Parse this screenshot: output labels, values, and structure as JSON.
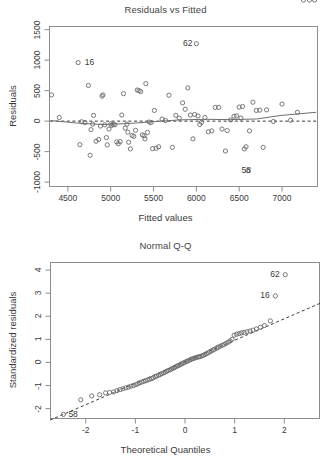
{
  "figure": {
    "kind": "r-regression-diagnostic-plots",
    "panel_count": 2
  },
  "panels": [
    {
      "id": "residuals-vs-fitted",
      "title": "Residuals vs Fitted",
      "xlabel": "Fitted values",
      "ylabel": "Residuals",
      "xticks": [
        "4500",
        "5000",
        "5500",
        "6000",
        "6500",
        "7000"
      ],
      "yticks": [
        "1500",
        "1000",
        "500",
        "0",
        "-500",
        "-1000"
      ],
      "point_labels": [
        {
          "text": "62",
          "x": 6020,
          "y": 1270,
          "side": "left"
        },
        {
          "text": "16",
          "x": 4640,
          "y": 960,
          "side": "right"
        },
        {
          "text": "58",
          "x": 6470,
          "y": -810,
          "side": "right"
        }
      ]
    },
    {
      "id": "normal-q-q",
      "title": "Normal Q-Q",
      "xlabel": "Theoretical Quantiles",
      "ylabel": "Standardized residuals",
      "xticks": [
        "-2",
        "-1",
        "0",
        "1",
        "2"
      ],
      "yticks": [
        "-2",
        "-1",
        "0",
        "1",
        "2",
        "3",
        "4"
      ],
      "point_labels": [
        {
          "text": "62",
          "x": 2.02,
          "y": 3.8,
          "side": "left"
        },
        {
          "text": "16",
          "x": 1.82,
          "y": 2.88,
          "side": "left"
        },
        {
          "text": "58",
          "x": -2.45,
          "y": -2.25,
          "side": "right"
        }
      ]
    }
  ],
  "chart_data": [
    {
      "type": "scatter",
      "title": "Residuals vs Fitted",
      "xlabel": "Fitted values",
      "ylabel": "Residuals",
      "xlim": [
        4280,
        7420
      ],
      "ylim": [
        -1080,
        1560
      ],
      "xticks": [
        4500,
        5000,
        5500,
        6000,
        6500,
        7000
      ],
      "yticks": [
        -1000,
        -500,
        0,
        500,
        1000,
        1500
      ],
      "grid": false,
      "legend": null,
      "reference_line": {
        "type": "horizontal-dashed",
        "y": 0
      },
      "smoother": {
        "type": "lowess",
        "x": [
          4300,
          4600,
          4900,
          5200,
          5500,
          5800,
          6100,
          6400,
          6700,
          7000,
          7400
        ],
        "y": [
          10,
          -30,
          -55,
          -40,
          -10,
          20,
          30,
          25,
          35,
          95,
          145
        ]
      },
      "x": [
        4310,
        4400,
        4620,
        4640,
        4660,
        4700,
        4740,
        4760,
        4770,
        4790,
        4800,
        4830,
        4860,
        4880,
        4900,
        4910,
        4930,
        4950,
        4960,
        4980,
        5000,
        5010,
        5030,
        5050,
        5070,
        5090,
        5110,
        5130,
        5150,
        5170,
        5190,
        5200,
        5210,
        5230,
        5250,
        5270,
        5290,
        5310,
        5330,
        5350,
        5370,
        5390,
        5400,
        5410,
        5430,
        5450,
        5470,
        5490,
        5510,
        5530,
        5560,
        5600,
        5640,
        5680,
        5720,
        5760,
        5800,
        5840,
        5870,
        5900,
        5930,
        5960,
        5980,
        6000,
        6020,
        6040,
        6060,
        6100,
        6140,
        6180,
        6220,
        6260,
        6300,
        6340,
        6360,
        6400,
        6440,
        6470,
        6500,
        6520,
        6540,
        6560,
        6580,
        6600,
        6620,
        6660,
        6700,
        6740,
        6780,
        6820,
        6900,
        7000,
        7100,
        7180,
        7250,
        7320,
        7380
      ],
      "y": [
        430,
        60,
        960,
        -385,
        -10,
        -25,
        585,
        -560,
        -140,
        -50,
        95,
        -330,
        -300,
        -80,
        410,
        430,
        -60,
        -270,
        -390,
        -130,
        -45,
        -70,
        -55,
        -60,
        -340,
        -370,
        -335,
        100,
        450,
        -115,
        -50,
        -180,
        -345,
        -455,
        -235,
        -250,
        -150,
        510,
        500,
        485,
        -225,
        -240,
        -290,
        615,
        -185,
        -15,
        -25,
        -450,
        175,
        -445,
        -420,
        35,
        10,
        425,
        -430,
        95,
        50,
        300,
        195,
        545,
        100,
        -290,
        110,
        1270,
        85,
        -55,
        -20,
        60,
        -175,
        -160,
        225,
        225,
        -130,
        -490,
        -155,
        20,
        80,
        85,
        230,
        50,
        240,
        -455,
        -420,
        -810,
        -160,
        310,
        175,
        180,
        -430,
        185,
        -5,
        280,
        15,
        145
      ],
      "labeled_points": [
        {
          "label": "62",
          "x": 6020,
          "y": 1270
        },
        {
          "label": "16",
          "x": 4640,
          "y": 960
        },
        {
          "label": "58",
          "x": 6470,
          "y": -810
        }
      ]
    },
    {
      "type": "scatter",
      "title": "Normal Q-Q",
      "xlabel": "Theoretical Quantiles",
      "ylabel": "Standardized residuals",
      "xlim": [
        -2.72,
        2.72
      ],
      "ylim": [
        -2.45,
        4.35
      ],
      "xticks": [
        -2,
        -1,
        0,
        1,
        2
      ],
      "yticks": [
        -2,
        -1,
        0,
        1,
        2,
        3,
        4
      ],
      "grid": false,
      "legend": null,
      "reference_line": {
        "type": "qq-line-dashed",
        "slope": 0.93,
        "intercept": 0.03
      },
      "x": [
        -2.45,
        -2.1,
        -1.88,
        -1.72,
        -1.6,
        -1.52,
        -1.44,
        -1.37,
        -1.31,
        -1.25,
        -1.19,
        -1.14,
        -1.09,
        -1.04,
        -0.99,
        -0.95,
        -0.91,
        -0.87,
        -0.83,
        -0.79,
        -0.75,
        -0.71,
        -0.67,
        -0.64,
        -0.6,
        -0.57,
        -0.53,
        -0.5,
        -0.47,
        -0.43,
        -0.4,
        -0.37,
        -0.34,
        -0.3,
        -0.27,
        -0.24,
        -0.21,
        -0.18,
        -0.15,
        -0.12,
        -0.09,
        -0.06,
        -0.03,
        0.0,
        0.03,
        0.06,
        0.09,
        0.12,
        0.15,
        0.18,
        0.21,
        0.24,
        0.27,
        0.3,
        0.34,
        0.37,
        0.4,
        0.43,
        0.47,
        0.5,
        0.53,
        0.57,
        0.6,
        0.64,
        0.67,
        0.71,
        0.75,
        0.79,
        0.83,
        0.87,
        0.91,
        0.95,
        0.99,
        1.04,
        1.09,
        1.14,
        1.19,
        1.25,
        1.31,
        1.37,
        1.44,
        1.52,
        1.6,
        1.72,
        1.82,
        2.02
      ],
      "y": [
        -2.25,
        -1.62,
        -1.45,
        -1.4,
        -1.32,
        -1.3,
        -1.28,
        -1.22,
        -1.18,
        -1.14,
        -1.1,
        -1.07,
        -1.03,
        -1.0,
        -0.96,
        -0.92,
        -0.88,
        -0.85,
        -0.82,
        -0.79,
        -0.76,
        -0.73,
        -0.7,
        -0.66,
        -0.62,
        -0.59,
        -0.55,
        -0.52,
        -0.49,
        -0.45,
        -0.42,
        -0.39,
        -0.35,
        -0.32,
        -0.28,
        -0.25,
        -0.22,
        -0.18,
        -0.15,
        -0.12,
        -0.09,
        -0.05,
        -0.02,
        0.01,
        0.04,
        0.07,
        0.1,
        0.13,
        0.16,
        0.18,
        0.2,
        0.22,
        0.24,
        0.25,
        0.28,
        0.31,
        0.34,
        0.38,
        0.42,
        0.46,
        0.5,
        0.54,
        0.58,
        0.62,
        0.66,
        0.7,
        0.74,
        0.78,
        0.83,
        0.88,
        0.93,
        1.0,
        1.18,
        1.22,
        1.25,
        1.28,
        1.3,
        1.33,
        1.36,
        1.4,
        1.45,
        1.52,
        1.6,
        1.8,
        2.88,
        3.8
      ],
      "labeled_points": [
        {
          "label": "62",
          "x": 2.02,
          "y": 3.8
        },
        {
          "label": "16",
          "x": 1.82,
          "y": 2.88
        },
        {
          "label": "58",
          "x": -2.45,
          "y": -2.25
        }
      ]
    }
  ]
}
